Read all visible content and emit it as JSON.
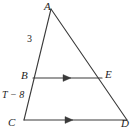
{
  "figure": {
    "type": "geometry-diagram",
    "background_color": "#ffffff",
    "stroke_color": "#3a3a3a",
    "text_color": "#1d1d1d",
    "vertices": {
      "A": {
        "label": "A",
        "x": 51,
        "y": 9
      },
      "B": {
        "label": "B",
        "x": 33,
        "y": 78
      },
      "C": {
        "label": "C",
        "x": 24,
        "y": 120
      },
      "D": {
        "label": "D",
        "x": 127,
        "y": 120
      },
      "E": {
        "label": "E",
        "x": 102,
        "y": 78
      }
    },
    "segments": [
      {
        "name": "A-C",
        "from": "A",
        "to": "C"
      },
      {
        "name": "A-D",
        "from": "A",
        "to": "D"
      },
      {
        "name": "B-E",
        "from": "B",
        "to": "E",
        "marker": "single-arrow"
      },
      {
        "name": "C-D",
        "from": "C",
        "to": "D",
        "marker": "single-arrow"
      }
    ],
    "measure_labels": {
      "segment_AB": "3",
      "segment_BC": "T − 8"
    }
  }
}
